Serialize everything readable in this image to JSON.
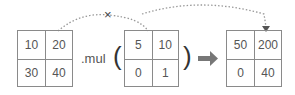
{
  "left_matrix": {
    "cells": [
      "10",
      "20",
      "30",
      "40"
    ]
  },
  "operator": {
    "label": ".mul",
    "open_paren": "(",
    "close_paren": ")"
  },
  "arg_matrix": {
    "cells": [
      "5",
      "10",
      "0",
      "1"
    ]
  },
  "result_matrix": {
    "cells": [
      "50",
      "200",
      "0",
      "40"
    ]
  },
  "annotations": {
    "blocked_mark": "×"
  },
  "colors": {
    "line": "#8a8a8a",
    "arrow": "#6b6b6b",
    "text": "#555555"
  }
}
